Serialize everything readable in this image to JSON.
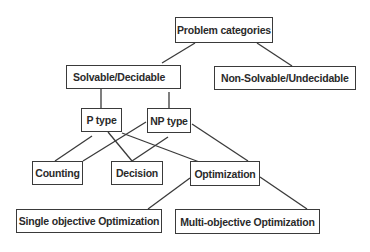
{
  "diagram": {
    "type": "tree",
    "colors": {
      "line": "#3a3a3a",
      "text": "#2a2a2a",
      "background": "#ffffff"
    },
    "nodes": {
      "root": {
        "label": "Problem categories"
      },
      "solvable": {
        "label": "Solvable/Decidable"
      },
      "non_solvable": {
        "label": "Non-Solvable/Undecidable"
      },
      "p_type": {
        "label": "P type"
      },
      "np_type": {
        "label": "NP type"
      },
      "counting": {
        "label": "Counting"
      },
      "decision": {
        "label": "Decision"
      },
      "optimization": {
        "label": "Optimization"
      },
      "single_obj": {
        "label": "Single objective Optimization"
      },
      "multi_obj": {
        "label": "Multi-objective Optimization"
      }
    },
    "edges": [
      [
        "Problem categories",
        "Solvable/Decidable"
      ],
      [
        "Problem categories",
        "Non-Solvable/Undecidable"
      ],
      [
        "Solvable/Decidable",
        "P type"
      ],
      [
        "Solvable/Decidable",
        "NP type"
      ],
      [
        "P type",
        "Counting"
      ],
      [
        "P type",
        "Decision"
      ],
      [
        "P type",
        "Optimization"
      ],
      [
        "NP type",
        "Counting"
      ],
      [
        "NP type",
        "Decision"
      ],
      [
        "NP type",
        "Optimization"
      ],
      [
        "Optimization",
        "Single objective Optimization"
      ],
      [
        "Optimization",
        "Multi-objective Optimization"
      ]
    ]
  }
}
